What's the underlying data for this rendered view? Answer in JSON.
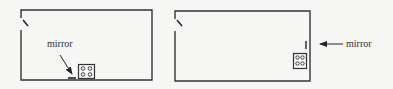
{
  "figure": {
    "panels": [
      {
        "id": "left",
        "label": "mirror",
        "description": "Room with door at top-left, mirror on bottom wall beside stove"
      },
      {
        "id": "right",
        "label": "mirror",
        "description": "Room with door at top-left, mirror on right wall above stove"
      }
    ],
    "colors": {
      "line": "#333333",
      "background": "#f6f6f4"
    }
  }
}
